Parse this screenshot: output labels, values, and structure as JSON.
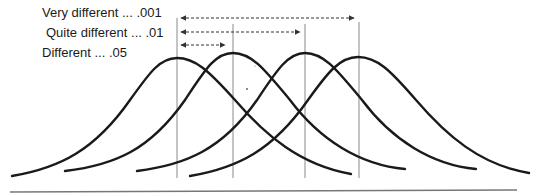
{
  "diagram": {
    "type": "overlapping-normal-distributions",
    "labels": [
      {
        "text": "Very different ... .001",
        "significance": ".001",
        "arrow_from_curve": 1,
        "arrow_to_curve": 4
      },
      {
        "text": "Quite different ... .01",
        "significance": ".01",
        "arrow_from_curve": 1,
        "arrow_to_curve": 3
      },
      {
        "text": "Different ... .05",
        "significance": ".05",
        "arrow_from_curve": 1,
        "arrow_to_curve": 2
      }
    ],
    "curves": [
      {
        "name": "curve-1",
        "mean_x": 177
      },
      {
        "name": "curve-2",
        "mean_x": 233
      },
      {
        "name": "curve-3",
        "mean_x": 305
      },
      {
        "name": "curve-4",
        "mean_x": 359
      }
    ],
    "colors": {
      "curve": "#1a1a1a",
      "mean_line": "#8a8a8a",
      "arrow": "#333333",
      "baseline": "#777777",
      "text": "#1a1a1a"
    }
  }
}
